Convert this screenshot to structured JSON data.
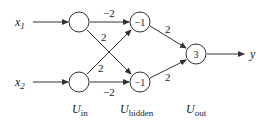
{
  "diagram": {
    "type": "neural-network",
    "inputs": [
      {
        "id": "x1",
        "label": "x",
        "sub": "1"
      },
      {
        "id": "x2",
        "label": "x",
        "sub": "2"
      }
    ],
    "output_label": "y",
    "nodes": {
      "in1": {
        "value": ""
      },
      "in2": {
        "value": ""
      },
      "h1": {
        "value": "−1"
      },
      "h2": {
        "value": "−1"
      },
      "out": {
        "value": "3"
      }
    },
    "weights": {
      "in1_h1": "−2",
      "in1_h2": "2",
      "in2_h1": "2",
      "in2_h2": "−2",
      "h1_out": "2",
      "h2_out": "2"
    },
    "layers": [
      {
        "label": "U",
        "sub": "in"
      },
      {
        "label": "U",
        "sub": "hidden"
      },
      {
        "label": "U",
        "sub": "out"
      }
    ]
  }
}
